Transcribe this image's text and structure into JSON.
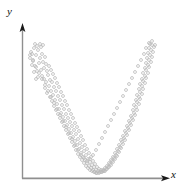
{
  "figure": {
    "background_color": "#ffffff",
    "width": 182,
    "height": 196
  },
  "axes": {
    "x_label": "x",
    "y_label": "y",
    "axis_color": "#8a8a8a",
    "arrow_color": "#1a1a1a",
    "x_axis_y": 178,
    "y_axis_x": 22,
    "x_axis_start": 22,
    "x_axis_end": 170,
    "y_axis_top": 26,
    "y_axis_bottom": 178
  },
  "chart_data": {
    "type": "scatter",
    "title": "",
    "xlabel": "x",
    "ylabel": "y",
    "grid": false,
    "legend": null,
    "marker": {
      "shape": "open-circle",
      "size": 2.0,
      "color": "#b9b9b9",
      "fill": "none"
    },
    "xlim": [
      22,
      170
    ],
    "ylim": [
      178,
      26
    ],
    "curve": {
      "form": "parabola",
      "vertex_x": 96,
      "vertex_y": 166,
      "curvature": 0.0195,
      "band_halfwidth": 5
    },
    "points": [
      [
        31,
        52
      ],
      [
        34,
        48
      ],
      [
        36,
        55
      ],
      [
        33,
        60
      ],
      [
        38,
        50
      ],
      [
        40,
        58
      ],
      [
        35,
        66
      ],
      [
        39,
        63
      ],
      [
        42,
        54
      ],
      [
        37,
        71
      ],
      [
        43,
        62
      ],
      [
        45,
        57
      ],
      [
        41,
        70
      ],
      [
        44,
        68
      ],
      [
        46,
        64
      ],
      [
        38,
        77
      ],
      [
        42,
        76
      ],
      [
        47,
        71
      ],
      [
        49,
        66
      ],
      [
        44,
        79
      ],
      [
        48,
        75
      ],
      [
        51,
        70
      ],
      [
        46,
        82
      ],
      [
        50,
        80
      ],
      [
        53,
        74
      ],
      [
        45,
        88
      ],
      [
        49,
        86
      ],
      [
        52,
        82
      ],
      [
        55,
        78
      ],
      [
        47,
        93
      ],
      [
        51,
        91
      ],
      [
        54,
        87
      ],
      [
        57,
        83
      ],
      [
        50,
        97
      ],
      [
        53,
        95
      ],
      [
        56,
        91
      ],
      [
        59,
        87
      ],
      [
        52,
        101
      ],
      [
        55,
        100
      ],
      [
        58,
        96
      ],
      [
        61,
        92
      ],
      [
        54,
        106
      ],
      [
        57,
        104
      ],
      [
        60,
        100
      ],
      [
        63,
        96
      ],
      [
        56,
        110
      ],
      [
        59,
        109
      ],
      [
        62,
        105
      ],
      [
        65,
        101
      ],
      [
        58,
        114
      ],
      [
        61,
        113
      ],
      [
        64,
        109
      ],
      [
        67,
        105
      ],
      [
        60,
        118
      ],
      [
        63,
        117
      ],
      [
        66,
        114
      ],
      [
        69,
        110
      ],
      [
        62,
        122
      ],
      [
        65,
        121
      ],
      [
        68,
        118
      ],
      [
        71,
        114
      ],
      [
        64,
        126
      ],
      [
        67,
        125
      ],
      [
        70,
        122
      ],
      [
        73,
        118
      ],
      [
        66,
        130
      ],
      [
        69,
        129
      ],
      [
        72,
        126
      ],
      [
        75,
        123
      ],
      [
        68,
        134
      ],
      [
        71,
        133
      ],
      [
        74,
        130
      ],
      [
        77,
        127
      ],
      [
        70,
        138
      ],
      [
        73,
        137
      ],
      [
        76,
        134
      ],
      [
        79,
        131
      ],
      [
        72,
        142
      ],
      [
        75,
        141
      ],
      [
        78,
        139
      ],
      [
        81,
        136
      ],
      [
        74,
        146
      ],
      [
        77,
        145
      ],
      [
        80,
        143
      ],
      [
        83,
        140
      ],
      [
        76,
        150
      ],
      [
        79,
        149
      ],
      [
        82,
        147
      ],
      [
        85,
        145
      ],
      [
        78,
        154
      ],
      [
        81,
        153
      ],
      [
        84,
        151
      ],
      [
        87,
        149
      ],
      [
        80,
        157
      ],
      [
        83,
        157
      ],
      [
        86,
        155
      ],
      [
        89,
        153
      ],
      [
        82,
        160
      ],
      [
        85,
        160
      ],
      [
        88,
        159
      ],
      [
        91,
        157
      ],
      [
        84,
        163
      ],
      [
        87,
        163
      ],
      [
        90,
        162
      ],
      [
        93,
        161
      ],
      [
        86,
        166
      ],
      [
        89,
        166
      ],
      [
        92,
        165
      ],
      [
        95,
        164
      ],
      [
        88,
        168
      ],
      [
        91,
        168
      ],
      [
        94,
        167
      ],
      [
        97,
        167
      ],
      [
        90,
        170
      ],
      [
        93,
        170
      ],
      [
        96,
        170
      ],
      [
        99,
        169
      ],
      [
        92,
        171
      ],
      [
        95,
        172
      ],
      [
        98,
        171
      ],
      [
        101,
        170
      ],
      [
        94,
        172
      ],
      [
        97,
        173
      ],
      [
        100,
        172
      ],
      [
        103,
        171
      ],
      [
        96,
        173
      ],
      [
        99,
        173
      ],
      [
        102,
        172
      ],
      [
        105,
        171
      ],
      [
        101,
        172
      ],
      [
        104,
        171
      ],
      [
        107,
        169
      ],
      [
        103,
        170
      ],
      [
        106,
        169
      ],
      [
        109,
        167
      ],
      [
        105,
        168
      ],
      [
        108,
        167
      ],
      [
        111,
        165
      ],
      [
        107,
        166
      ],
      [
        110,
        164
      ],
      [
        113,
        162
      ],
      [
        109,
        163
      ],
      [
        112,
        161
      ],
      [
        115,
        159
      ],
      [
        111,
        160
      ],
      [
        114,
        158
      ],
      [
        117,
        156
      ],
      [
        113,
        157
      ],
      [
        116,
        155
      ],
      [
        119,
        152
      ],
      [
        115,
        153
      ],
      [
        118,
        151
      ],
      [
        121,
        148
      ],
      [
        117,
        149
      ],
      [
        120,
        147
      ],
      [
        123,
        144
      ],
      [
        119,
        145
      ],
      [
        122,
        142
      ],
      [
        125,
        140
      ],
      [
        121,
        140
      ],
      [
        124,
        138
      ],
      [
        127,
        135
      ],
      [
        123,
        136
      ],
      [
        126,
        133
      ],
      [
        129,
        130
      ],
      [
        125,
        131
      ],
      [
        128,
        128
      ],
      [
        131,
        125
      ],
      [
        127,
        126
      ],
      [
        130,
        123
      ],
      [
        133,
        120
      ],
      [
        129,
        121
      ],
      [
        132,
        118
      ],
      [
        135,
        115
      ],
      [
        131,
        116
      ],
      [
        134,
        113
      ],
      [
        137,
        110
      ],
      [
        133,
        110
      ],
      [
        136,
        107
      ],
      [
        139,
        104
      ],
      [
        134,
        105
      ],
      [
        137,
        102
      ],
      [
        140,
        99
      ],
      [
        136,
        100
      ],
      [
        139,
        97
      ],
      [
        142,
        94
      ],
      [
        137,
        95
      ],
      [
        140,
        92
      ],
      [
        143,
        89
      ],
      [
        139,
        89
      ],
      [
        142,
        86
      ],
      [
        145,
        83
      ],
      [
        140,
        84
      ],
      [
        143,
        81
      ],
      [
        146,
        78
      ],
      [
        142,
        79
      ],
      [
        145,
        76
      ],
      [
        148,
        73
      ],
      [
        143,
        73
      ],
      [
        146,
        70
      ],
      [
        149,
        67
      ],
      [
        145,
        68
      ],
      [
        148,
        65
      ],
      [
        151,
        62
      ],
      [
        146,
        63
      ],
      [
        149,
        60
      ],
      [
        152,
        57
      ],
      [
        147,
        58
      ],
      [
        150,
        55
      ],
      [
        153,
        52
      ],
      [
        148,
        53
      ],
      [
        151,
        50
      ],
      [
        154,
        47
      ],
      [
        149,
        48
      ],
      [
        152,
        45
      ],
      [
        30,
        58
      ],
      [
        32,
        65
      ],
      [
        34,
        72
      ],
      [
        36,
        79
      ],
      [
        32,
        54
      ],
      [
        41,
        47
      ],
      [
        43,
        45
      ],
      [
        146,
        48
      ],
      [
        150,
        44
      ],
      [
        144,
        54
      ],
      [
        141,
        60
      ],
      [
        138,
        66
      ],
      [
        135,
        72
      ],
      [
        132,
        78
      ],
      [
        129,
        84
      ],
      [
        126,
        90
      ],
      [
        123,
        96
      ],
      [
        120,
        102
      ],
      [
        117,
        108
      ],
      [
        114,
        114
      ],
      [
        111,
        120
      ],
      [
        108,
        126
      ],
      [
        105,
        132
      ],
      [
        102,
        138
      ],
      [
        99,
        144
      ],
      [
        96,
        150
      ],
      [
        93,
        155
      ],
      [
        90,
        159
      ],
      [
        87,
        161
      ],
      [
        84,
        158
      ],
      [
        81,
        155
      ],
      [
        78,
        150
      ],
      [
        75,
        145
      ],
      [
        72,
        139
      ],
      [
        69,
        133
      ],
      [
        66,
        127
      ],
      [
        63,
        121
      ],
      [
        60,
        115
      ],
      [
        57,
        109
      ],
      [
        54,
        103
      ],
      [
        51,
        97
      ],
      [
        48,
        91
      ],
      [
        45,
        85
      ],
      [
        42,
        79
      ],
      [
        39,
        73
      ],
      [
        36,
        67
      ],
      [
        33,
        61
      ],
      [
        30,
        55
      ],
      [
        152,
        41
      ],
      [
        149,
        43
      ],
      [
        37,
        46
      ],
      [
        40,
        44
      ],
      [
        155,
        45
      ],
      [
        35,
        44
      ]
    ]
  }
}
